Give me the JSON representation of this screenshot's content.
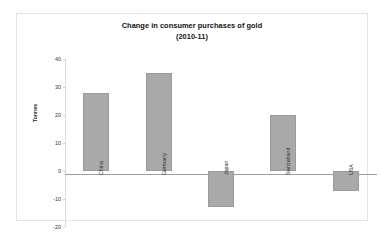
{
  "chart_data": {
    "type": "bar",
    "title": "Change in consumer purchases of gold",
    "subtitle": "(2010-11)",
    "xlabel": "",
    "ylabel": "Tonnes",
    "categories": [
      "China",
      "Germany",
      "Japan",
      "Switzerland",
      "USA"
    ],
    "values": [
      28,
      35,
      -13,
      20,
      -7
    ],
    "ylim": [
      -20,
      40
    ],
    "yticks": [
      40,
      30,
      20,
      10,
      0,
      -10,
      -20
    ],
    "ytick_labels": [
      "40",
      "30",
      "20",
      "10",
      "0",
      "-10",
      "-20"
    ],
    "grid": false,
    "legend": "none",
    "bar_color": "#a9a9a9",
    "bar_border_color": "#9a9a9a",
    "zero_line_color": "#9c9c9c",
    "axis_color": "#d9d9d9",
    "frame_color": "#e4e4e4",
    "background": "#ffffff"
  }
}
